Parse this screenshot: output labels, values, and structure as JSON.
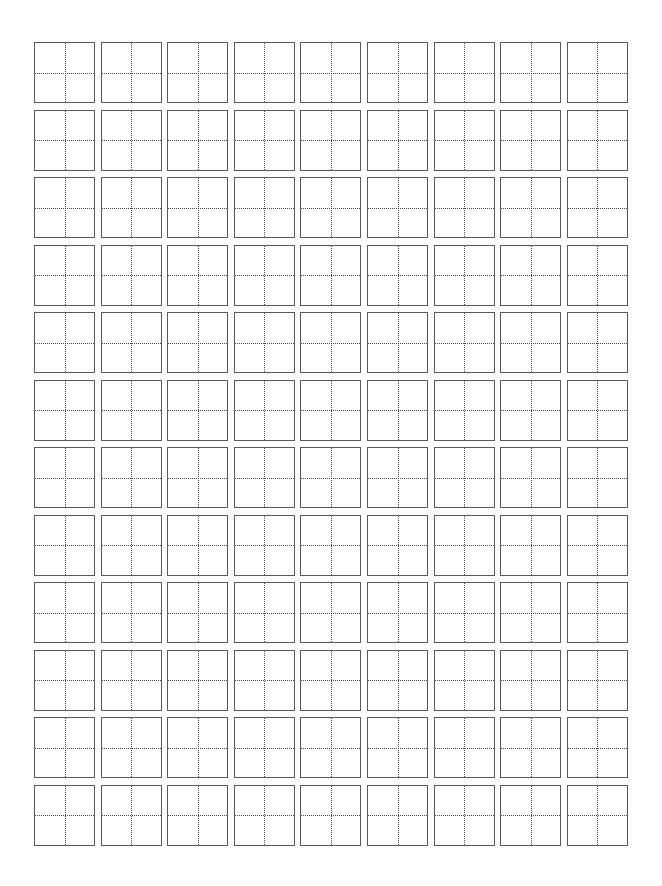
{
  "sheet": {
    "type": "tian-zi-ge practice grid",
    "rows": 12,
    "columns": 9,
    "cell_size_px": 61,
    "origin_x": 34,
    "origin_y": 42,
    "col_pitch": 66.6,
    "row_pitch": 67.5,
    "colors": {
      "border": "#5a5a5a",
      "guide": "#4a4a4a",
      "background": "#ffffff"
    }
  }
}
